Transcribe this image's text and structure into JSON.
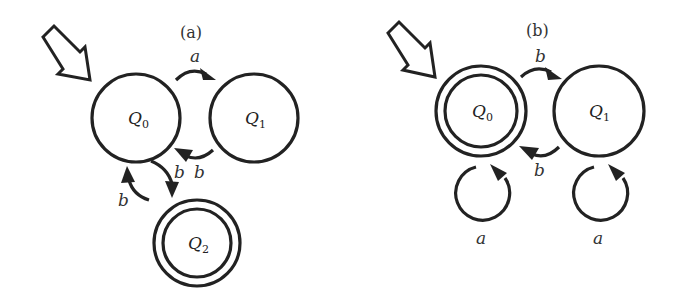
{
  "diagrams": [
    {
      "caption": "(a)",
      "start_state": "Q0",
      "states": [
        {
          "id": "Q0",
          "name": "Q",
          "sub": "0",
          "accepting": false
        },
        {
          "id": "Q1",
          "name": "Q",
          "sub": "1",
          "accepting": false
        },
        {
          "id": "Q2",
          "name": "Q",
          "sub": "2",
          "accepting": true
        }
      ],
      "transitions": [
        {
          "from": "Q0",
          "to": "Q1",
          "label": "a"
        },
        {
          "from": "Q1",
          "to": "Q0",
          "label": "b"
        },
        {
          "from": "Q0",
          "to": "Q2",
          "label": "b"
        },
        {
          "from": "Q2",
          "to": "Q0",
          "label": "b"
        }
      ]
    },
    {
      "caption": "(b)",
      "start_state": "Q0",
      "states": [
        {
          "id": "Q0",
          "name": "Q",
          "sub": "0",
          "accepting": true
        },
        {
          "id": "Q1",
          "name": "Q",
          "sub": "1",
          "accepting": false
        }
      ],
      "transitions": [
        {
          "from": "Q0",
          "to": "Q1",
          "label": "b"
        },
        {
          "from": "Q1",
          "to": "Q0",
          "label": "b"
        },
        {
          "from": "Q0",
          "to": "Q0",
          "label": "a"
        },
        {
          "from": "Q1",
          "to": "Q1",
          "label": "a"
        }
      ]
    }
  ]
}
